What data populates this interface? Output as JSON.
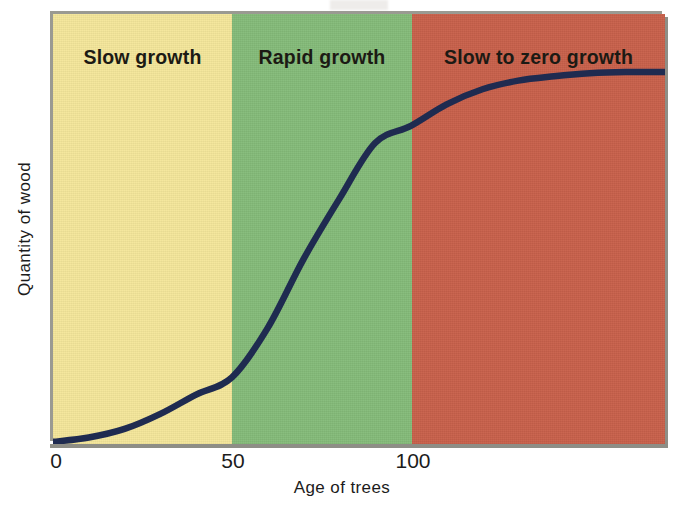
{
  "figure": {
    "title": "",
    "colors": {
      "band_slow_growth": "#F5E79B",
      "band_rapid_growth": "#85BC7A",
      "band_slow_to_zero_growth": "#C9614B",
      "curve": "#1F2B50",
      "axis": "#8E8E86",
      "text": "#1C1C1C"
    }
  },
  "axes": {
    "xlabel": "Age of trees",
    "ylabel": "Quantity of wood",
    "xticks": [
      {
        "label": "0",
        "value": 0
      },
      {
        "label": "50",
        "value": 50
      },
      {
        "label": "100",
        "value": 100
      }
    ],
    "yticks": []
  },
  "bands": [
    {
      "label": "Slow growth",
      "x_start": 0,
      "x_end": 50,
      "color": "#F5E79B"
    },
    {
      "label": "Rapid growth",
      "x_start": 50,
      "x_end": 100,
      "color": "#85BC7A"
    },
    {
      "label": "Slow to zero growth",
      "x_start": 100,
      "x_end": 171,
      "color": "#C9614B"
    }
  ],
  "chart_data": {
    "type": "line",
    "title": "",
    "subtitle": "",
    "xlabel": "Age of trees",
    "ylabel": "Quantity of wood",
    "xlim": [
      0,
      171
    ],
    "ylim": [
      0,
      100
    ],
    "grid": false,
    "legend": "none",
    "annotations": [
      {
        "text": "Slow growth",
        "x_range": [
          0,
          50
        ]
      },
      {
        "text": "Rapid growth",
        "x_range": [
          50,
          100
        ]
      },
      {
        "text": "Slow to zero growth",
        "x_range": [
          100,
          171
        ]
      }
    ],
    "series": [
      {
        "name": "Quantity of wood",
        "color": "#1F2B50",
        "x": [
          0,
          10,
          20,
          30,
          40,
          50,
          60,
          70,
          80,
          90,
          100,
          110,
          120,
          130,
          140,
          150,
          160,
          171
        ],
        "y": [
          0.5,
          1.5,
          3.5,
          7,
          11.5,
          15.5,
          27,
          43,
          57,
          70,
          74,
          79,
          82.5,
          84.5,
          85.5,
          86.2,
          86.5,
          86.5
        ]
      }
    ]
  }
}
